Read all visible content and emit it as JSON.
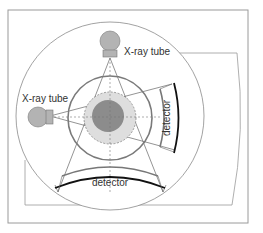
{
  "diagram": {
    "labels": {
      "tube_top": "X-ray tube",
      "tube_left": "X-ray tube",
      "detector_bottom": "detector",
      "detector_right": "detector"
    },
    "colors": {
      "frame": "#9a9a9a",
      "ring": "#7a7a7a",
      "tube_fill": "#b3b3b3",
      "patient_outer": "#dcdcdc",
      "patient_inner": "#8a8a8a",
      "detector_dark": "#111111",
      "detector_gray": "#777777"
    }
  }
}
